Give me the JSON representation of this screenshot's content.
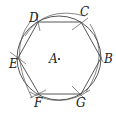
{
  "diagram": {
    "colors": {
      "stroke": "#444444",
      "text": "#222222",
      "background": "#ffffff"
    },
    "circle": {
      "center_label": "A",
      "cx": 59,
      "cy": 58,
      "r": 42
    },
    "vertices": [
      {
        "label": "D",
        "x": 38,
        "y": 22,
        "lx": 29,
        "ly": 22
      },
      {
        "label": "C",
        "x": 81,
        "y": 22,
        "lx": 81,
        "ly": 15
      },
      {
        "label": "B",
        "x": 101,
        "y": 58,
        "lx": 105,
        "ly": 63
      },
      {
        "label": "G",
        "x": 81,
        "y": 94,
        "lx": 77,
        "ly": 107
      },
      {
        "label": "F",
        "x": 39,
        "y": 94,
        "lx": 35,
        "ly": 107
      },
      {
        "label": "E",
        "x": 18,
        "y": 58,
        "lx": 10,
        "ly": 68
      }
    ],
    "center_point": {
      "label": "A",
      "x": 59,
      "y": 59,
      "lx": 50,
      "ly": 63
    }
  }
}
